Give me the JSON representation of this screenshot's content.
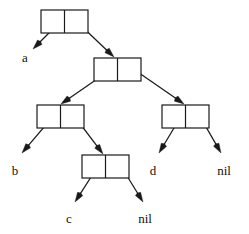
{
  "diagram": {
    "type": "cons-cell-diagram",
    "width": 249,
    "height": 234,
    "background_color": "#ffffff",
    "stroke_color": "#1a1a1a",
    "text_color": "#111111",
    "cells": [
      {
        "id": "cell-1",
        "name": "root-cons-cell",
        "x": 41,
        "y": 10,
        "width": 47,
        "height": 23,
        "car_label": "a",
        "cdr_label": "cell-2"
      },
      {
        "id": "cell-2",
        "name": "second-cons-cell",
        "x": 94,
        "y": 58,
        "width": 47,
        "height": 23,
        "car_label": "cell-3",
        "cdr_label": "cell-4"
      },
      {
        "id": "cell-3",
        "name": "third-cons-cell",
        "x": 37,
        "y": 105,
        "width": 47,
        "height": 23,
        "car_label": "b",
        "cdr_label": "cell-5"
      },
      {
        "id": "cell-4",
        "name": "fourth-cons-cell",
        "x": 162,
        "y": 105,
        "width": 47,
        "height": 23,
        "car_label": "d",
        "cdr_label": "nil"
      },
      {
        "id": "cell-5",
        "name": "fifth-cons-cell",
        "x": 82,
        "y": 155,
        "width": 47,
        "height": 23,
        "car_label": "c",
        "cdr_label": "nil"
      }
    ],
    "pointers": [
      {
        "id": "ptr-1",
        "name": "pointer-cell1-car-to-a",
        "from_cell": "cell-1",
        "slot": "car",
        "x1": 64,
        "y1": 18,
        "x2": 33,
        "y2": 49,
        "target": "a"
      },
      {
        "id": "ptr-2",
        "name": "pointer-cell1-cdr-to-cell2",
        "from_cell": "cell-1",
        "slot": "cdr",
        "x1": 74,
        "y1": 19,
        "x2": 114,
        "y2": 57,
        "target": "cell-2"
      },
      {
        "id": "ptr-3",
        "name": "pointer-cell2-car-to-cell3",
        "from_cell": "cell-2",
        "slot": "car",
        "x1": 116,
        "y1": 66,
        "x2": 61,
        "y2": 104,
        "target": "cell-3"
      },
      {
        "id": "ptr-4",
        "name": "pointer-cell2-cdr-to-cell4",
        "from_cell": "cell-2",
        "slot": "cdr",
        "x1": 129,
        "y1": 66,
        "x2": 184,
        "y2": 104,
        "target": "cell-4"
      },
      {
        "id": "ptr-5",
        "name": "pointer-cell3-car-to-b",
        "from_cell": "cell-3",
        "slot": "car",
        "x1": 56,
        "y1": 113,
        "x2": 22,
        "y2": 153,
        "target": "b"
      },
      {
        "id": "ptr-6",
        "name": "pointer-cell3-cdr-to-cell5",
        "from_cell": "cell-3",
        "slot": "cdr",
        "x1": 72,
        "y1": 113,
        "x2": 103,
        "y2": 154,
        "target": "cell-5"
      },
      {
        "id": "ptr-7",
        "name": "pointer-cell4-car-to-d",
        "from_cell": "cell-4",
        "slot": "car",
        "x1": 183,
        "y1": 113,
        "x2": 159,
        "y2": 153,
        "target": "d"
      },
      {
        "id": "ptr-8",
        "name": "pointer-cell4-cdr-to-nil",
        "from_cell": "cell-4",
        "slot": "cdr",
        "x1": 198,
        "y1": 113,
        "x2": 221,
        "y2": 153,
        "target": "nil"
      },
      {
        "id": "ptr-9",
        "name": "pointer-cell5-car-to-c",
        "from_cell": "cell-5",
        "slot": "car",
        "x1": 100,
        "y1": 163,
        "x2": 75,
        "y2": 202,
        "target": "c"
      },
      {
        "id": "ptr-10",
        "name": "pointer-cell5-cdr-to-nil",
        "from_cell": "cell-5",
        "slot": "cdr",
        "x1": 119,
        "y1": 163,
        "x2": 143,
        "y2": 202,
        "target": "nil"
      }
    ],
    "labels": [
      {
        "id": "label-a",
        "name": "atom-label-a",
        "text": "a",
        "x": 25,
        "y": 62
      },
      {
        "id": "label-b",
        "name": "atom-label-b",
        "text": "b",
        "x": 15,
        "y": 175
      },
      {
        "id": "label-c",
        "name": "atom-label-c",
        "text": "c",
        "x": 69,
        "y": 223
      },
      {
        "id": "label-d",
        "name": "atom-label-d",
        "text": "d",
        "x": 153,
        "y": 175
      },
      {
        "id": "label-nil1",
        "name": "atom-label-nil-right",
        "text": "nil",
        "x": 224,
        "y": 175
      },
      {
        "id": "label-nil2",
        "name": "atom-label-nil-bottom",
        "text": "nil",
        "x": 145,
        "y": 223
      }
    ]
  }
}
